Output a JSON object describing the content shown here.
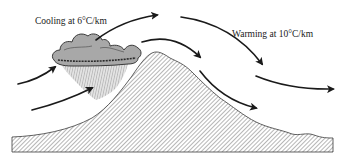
{
  "diagram": {
    "labels": {
      "cooling": "Cooling at 6°C/km",
      "warming": "Warming at 10°C/km"
    },
    "elements": {
      "mountain": "hatched-mountain",
      "cloud": "rain-cloud",
      "rain": "rain-shaft",
      "arrows": [
        {
          "id": "windward-lower-1",
          "from": [
            18,
            84
          ],
          "to": [
            55,
            67
          ]
        },
        {
          "id": "windward-lower-2",
          "from": [
            32,
            110
          ],
          "to": [
            92,
            88
          ]
        },
        {
          "id": "over-cloud",
          "from": [
            96,
            40
          ],
          "to": [
            157,
            15
          ]
        },
        {
          "id": "over-peak",
          "from": [
            142,
            42
          ],
          "to": [
            200,
            57
          ]
        },
        {
          "id": "leeward-long",
          "from": [
            181,
            17
          ],
          "to": [
            262,
            64
          ]
        },
        {
          "id": "leeward-lower",
          "from": [
            200,
            71
          ],
          "to": [
            256,
            108
          ]
        },
        {
          "id": "leeward-far",
          "from": [
            256,
            76
          ],
          "to": [
            333,
            89
          ]
        }
      ]
    },
    "colors": {
      "ink": "#1a1a1a",
      "cloud_fill": "#a8a8a8",
      "rain": "#8c8c8c",
      "hatch": "#6e6e6e",
      "background": "#ffffff"
    }
  }
}
